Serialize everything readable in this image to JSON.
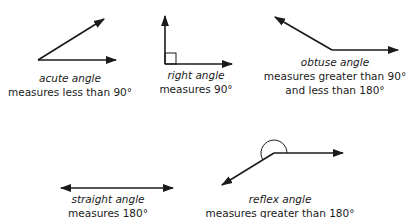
{
  "diagram": {
    "stroke_color": "#1a1a1a",
    "angles": [
      {
        "id": "acute",
        "name": "acute angle",
        "lines": [
          "measures less than 90°"
        ]
      },
      {
        "id": "right",
        "name": "right angle",
        "lines": [
          "measures 90°"
        ]
      },
      {
        "id": "obtuse",
        "name": "obtuse angle",
        "lines": [
          "measures greater than 90°",
          "and less than 180°"
        ]
      },
      {
        "id": "straight",
        "name": "straight angle",
        "lines": [
          "measures 180°"
        ]
      },
      {
        "id": "reflex",
        "name": "reflex angle",
        "lines": [
          "measures greater than 180°"
        ]
      }
    ]
  }
}
